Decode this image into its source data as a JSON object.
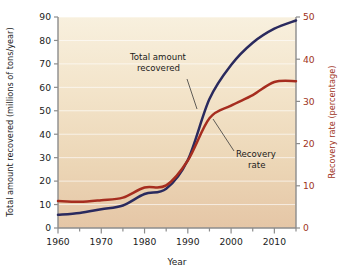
{
  "chart_data": {
    "type": "line",
    "title": "",
    "xlabel": "Year",
    "ylabel": "Total amount recovered (millions of tons/year)",
    "y2label": "Recovery rate (percentage)",
    "xlim": [
      1960,
      2015
    ],
    "ylim": [
      0,
      90
    ],
    "y2lim": [
      0,
      50
    ],
    "grid": "horizontal",
    "legend_position": "inline-annotations",
    "xticks": [
      1960,
      1970,
      1980,
      1990,
      2000,
      2010
    ],
    "xtick_labels": [
      "1960",
      "1970",
      "1980",
      "1990",
      "2000",
      "2010"
    ],
    "xminor_step": 5,
    "yticks": [
      0,
      10,
      20,
      30,
      40,
      50,
      60,
      70,
      80,
      90
    ],
    "ytick_labels": [
      "0",
      "10",
      "20",
      "30",
      "40",
      "50",
      "60",
      "70",
      "80",
      "90"
    ],
    "y2ticks": [
      0,
      10,
      20,
      30,
      40,
      50
    ],
    "y2tick_labels": [
      "0",
      "10",
      "20",
      "30",
      "40",
      "50"
    ],
    "series": [
      {
        "name": "Total amount recovered",
        "axis": "left",
        "color": "#2a2a5e",
        "units": "millions of tons/year",
        "x": [
          1960,
          1965,
          1970,
          1975,
          1980,
          1985,
          1990,
          1995,
          2000,
          2005,
          2010,
          2015
        ],
        "values": [
          5.6,
          6.4,
          8.0,
          9.6,
          14.5,
          16.7,
          29.0,
          55.0,
          69.5,
          79.0,
          85.0,
          88.5
        ]
      },
      {
        "name": "Recovery rate",
        "axis": "right",
        "color": "#a62d1f",
        "units": "percentage",
        "x": [
          1960,
          1965,
          1970,
          1975,
          1980,
          1985,
          1990,
          1995,
          2000,
          2005,
          2010,
          2015
        ],
        "values": [
          6.4,
          6.2,
          6.6,
          7.2,
          9.6,
          10.1,
          16.0,
          26.0,
          29.0,
          31.5,
          34.6,
          34.8
        ]
      }
    ],
    "annotations": [
      {
        "text_line1": "Total amount",
        "text_line2": "recovered",
        "target_series": "Total amount recovered"
      },
      {
        "text_line1": "Recovery",
        "text_line2": "rate",
        "target_series": "Recovery rate"
      }
    ],
    "colors": {
      "total_amount_line": "#2a2a5e",
      "recovery_rate_line": "#a62d1f",
      "plot_background_top": "#f7eedb",
      "plot_background_bottom": "#e6c9ab",
      "gridline": "#ffffff",
      "axis": "#8c8c8c",
      "page_background": "#ffffff"
    }
  }
}
